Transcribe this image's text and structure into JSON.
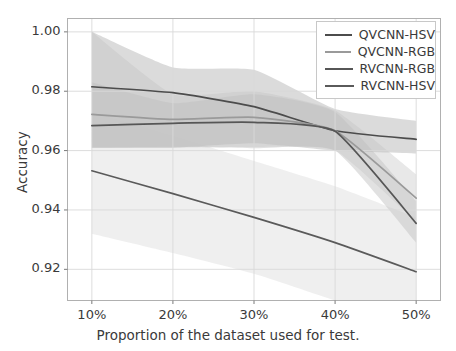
{
  "chart_data": {
    "type": "line",
    "title": "",
    "xlabel": "Proportion of the dataset used for test.",
    "ylabel": "Accuracy",
    "categories": [
      "10%",
      "20%",
      "30%",
      "40%",
      "50%"
    ],
    "x": [
      10,
      20,
      30,
      40,
      50
    ],
    "xlim": [
      7,
      53
    ],
    "ylim": [
      0.9095,
      1.0045
    ],
    "yticks": [
      0.92,
      0.94,
      0.96,
      0.98,
      1.0
    ],
    "ytick_labels": [
      "0.92",
      "0.94",
      "0.96",
      "0.98",
      "1.00"
    ],
    "xticks": [
      10,
      20,
      30,
      40,
      50
    ],
    "xtick_labels": [
      "10%",
      "20%",
      "30%",
      "40%",
      "50%"
    ],
    "grid": true,
    "legend_position": "upper right",
    "series": [
      {
        "name": "QVCNN-HSV",
        "color": "#4c4c4c",
        "values": [
          0.9815,
          0.9795,
          0.9748,
          0.9667,
          0.9638
        ],
        "band_lower": [
          0.961,
          0.961,
          0.9625,
          0.96,
          0.959
        ],
        "band_upper": [
          1.0,
          0.988,
          0.9872,
          0.974,
          0.97
        ],
        "band_color": "#bdbdbd",
        "band_opacity": 0.55
      },
      {
        "name": "QVCNN-RGB",
        "color": "#9a9a9a",
        "values": [
          0.9722,
          0.9705,
          0.9712,
          0.9667,
          0.944
        ],
        "band_lower": [
          0.961,
          0.961,
          0.9612,
          0.96,
          0.936
        ],
        "band_upper": [
          1.0,
          0.979,
          0.98,
          0.9735,
          0.952
        ],
        "band_color": "#d2d2d2",
        "band_opacity": 0.5
      },
      {
        "name": "RVCNN-RGB",
        "color": "#565656",
        "values": [
          0.9684,
          0.9692,
          0.9695,
          0.9665,
          0.9355
        ],
        "band_lower": [
          0.961,
          0.9613,
          0.9608,
          0.96,
          0.929
        ],
        "band_upper": [
          0.983,
          0.976,
          0.979,
          0.973,
          0.943
        ],
        "band_color": "#c4c4c4",
        "band_opacity": 0.5
      },
      {
        "name": "RVCNN-HSV",
        "color": "#5a5a5a",
        "values": [
          0.9532,
          0.9455,
          0.9375,
          0.929,
          0.9192
        ],
        "band_lower": [
          0.932,
          0.9255,
          0.9185,
          0.9095,
          0.901
        ],
        "band_upper": [
          0.973,
          0.965,
          0.9565,
          0.948,
          0.9375
        ],
        "band_color": "#ededed",
        "band_opacity": 0.9
      }
    ]
  },
  "axes": {
    "ylabel": "Accuracy",
    "xlabel": "Proportion of the dataset used for test."
  },
  "legend": {
    "entries": [
      {
        "label": "QVCNN-HSV",
        "color": "#4c4c4c"
      },
      {
        "label": "QVCNN-RGB",
        "color": "#9a9a9a"
      },
      {
        "label": "RVCNN-RGB",
        "color": "#565656"
      },
      {
        "label": "RVCNN-HSV",
        "color": "#5a5a5a"
      }
    ]
  }
}
